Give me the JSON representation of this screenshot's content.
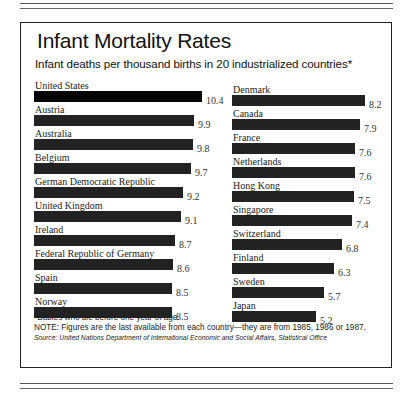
{
  "chart_data": {
    "type": "bar",
    "orientation": "horizontal",
    "title": "Infant Mortality Rates",
    "subtitle": "Infant deaths per thousand births in 20 industrialized countries*",
    "xlabel": "",
    "ylabel": "",
    "unit": "infant deaths per thousand births",
    "grid": false,
    "legend": null,
    "categories": [
      "United States",
      "Austria",
      "Australia",
      "Belgium",
      "German Democratic Republic",
      "United Kingdom",
      "Ireland",
      "Federal Republic of Germany",
      "Spain",
      "Norway",
      "Denmark",
      "Canada",
      "France",
      "Netherlands",
      "Hong Kong",
      "Singapore",
      "Switzerland",
      "Finland",
      "Sweden",
      "Japan"
    ],
    "values": [
      10.4,
      9.9,
      9.8,
      9.7,
      9.2,
      9.1,
      8.7,
      8.6,
      8.5,
      8.5,
      8.2,
      7.9,
      7.6,
      7.6,
      7.5,
      7.4,
      6.8,
      6.3,
      5.7,
      5.2
    ],
    "highlight": "United States"
  },
  "header": {
    "title": "Infant Mortality Rates",
    "subtitle": "Infant deaths per thousand births in 20 industrialized countries*"
  },
  "columns": {
    "left": [
      {
        "country": "United States",
        "value": "10.4",
        "num": 10.4
      },
      {
        "country": "Austria",
        "value": "9.9",
        "num": 9.9
      },
      {
        "country": "Australia",
        "value": "9.8",
        "num": 9.8
      },
      {
        "country": "Belgium",
        "value": "9.7",
        "num": 9.7
      },
      {
        "country": "German Democratic Republic",
        "value": "9.2",
        "num": 9.2
      },
      {
        "country": "United Kingdom",
        "value": "9.1",
        "num": 9.1
      },
      {
        "country": "Ireland",
        "value": "8.7",
        "num": 8.7
      },
      {
        "country": "Federal Republic of Germany",
        "value": "8.6",
        "num": 8.6
      },
      {
        "country": "Spain",
        "value": "8.5",
        "num": 8.5
      },
      {
        "country": "Norway",
        "value": "8.5",
        "num": 8.5
      }
    ],
    "right": [
      {
        "country": "Denmark",
        "value": "8.2",
        "num": 8.2
      },
      {
        "country": "Canada",
        "value": "7.9",
        "num": 7.9
      },
      {
        "country": "France",
        "value": "7.6",
        "num": 7.6
      },
      {
        "country": "Netherlands",
        "value": "7.6",
        "num": 7.6
      },
      {
        "country": "Hong Kong",
        "value": "7.5",
        "num": 7.5
      },
      {
        "country": "Singapore",
        "value": "7.4",
        "num": 7.4
      },
      {
        "country": "Switzerland",
        "value": "6.8",
        "num": 6.8
      },
      {
        "country": "Finland",
        "value": "6.3",
        "num": 6.3
      },
      {
        "country": "Sweden",
        "value": "5.7",
        "num": 5.7
      },
      {
        "country": "Japan",
        "value": "5.2",
        "num": 5.2
      }
    ]
  },
  "footer": {
    "footnote": "*Babies who die before one year of age.",
    "note": "NOTE: Figures are the last available from each country—they are from 1985, 1986 or 1987.",
    "source": "Source: United Nations Department of International Economic and Social Affairs, Statistical Office"
  },
  "colors": {
    "bar": "#222222",
    "highlight_bar": "#050505"
  }
}
